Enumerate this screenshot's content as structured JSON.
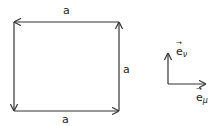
{
  "diagram": {
    "loop": {
      "side_labels": {
        "top": "a",
        "right": "a",
        "bottom": "a"
      },
      "orientation": "counterclockwise"
    },
    "basis": {
      "e_nu": {
        "base": "e",
        "sub": "ν",
        "arrow": "→"
      },
      "e_mu": {
        "base": "e",
        "sub": "μ",
        "arrow": "→"
      }
    }
  }
}
